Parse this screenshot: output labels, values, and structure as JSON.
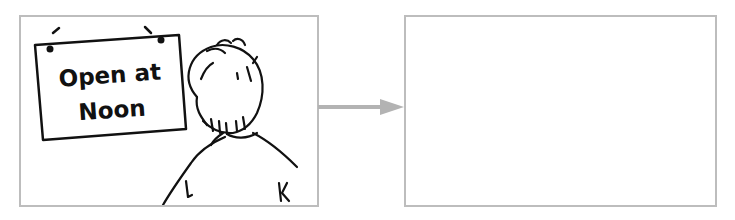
{
  "diagram": {
    "left_panel": {
      "sign": {
        "line1": "Open at",
        "line2": "Noon"
      },
      "figure": "person-viewed-from-behind"
    },
    "arrow": {
      "direction": "right",
      "color": "#b3b3b3"
    },
    "right_panel": {
      "content": ""
    },
    "colors": {
      "panel_border": "#bdbdbd",
      "ink": "#111111"
    }
  }
}
